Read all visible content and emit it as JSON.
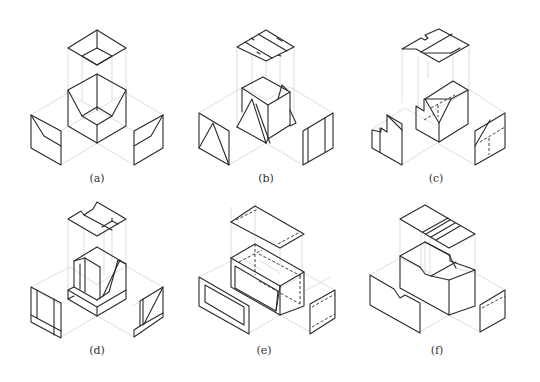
{
  "figure": {
    "panels": [
      {
        "id": "a",
        "label": "(a)",
        "x": 97,
        "y": 181
      },
      {
        "id": "b",
        "label": "(b)",
        "x": 266,
        "y": 181
      },
      {
        "id": "c",
        "label": "(c)",
        "x": 435,
        "y": 181
      },
      {
        "id": "d",
        "label": "(d)",
        "x": 97,
        "y": 353
      },
      {
        "id": "e",
        "label": "(e)",
        "x": 266,
        "y": 353
      },
      {
        "id": "f",
        "label": "(f)",
        "x": 435,
        "y": 353
      }
    ]
  },
  "colors": {
    "edge": "#2a2a2a",
    "projection_line": "#d2d2d2",
    "background": "#ffffff"
  }
}
